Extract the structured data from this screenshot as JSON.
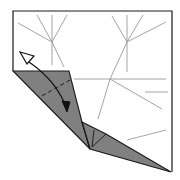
{
  "diagram": {
    "type": "origami-fold-step",
    "colors": {
      "paper_front": "#ffffff",
      "paper_back": "#808080",
      "outline": "#1a1a1a",
      "crease": "#9a9a9a",
      "arrow": "#111111"
    },
    "paper_outline": [
      [
        13,
        11
      ],
      [
        172,
        11
      ],
      [
        172,
        172
      ]
    ],
    "left_flap": [
      [
        13,
        71
      ],
      [
        69,
        71
      ],
      [
        82,
        122
      ],
      [
        90,
        149
      ]
    ],
    "lower_flap": [
      [
        82,
        122
      ],
      [
        106,
        134
      ],
      [
        171,
        172
      ],
      [
        90,
        149
      ]
    ],
    "crease_lines": [
      [
        18,
        23,
        52,
        42
      ],
      [
        37,
        15,
        52,
        42
      ],
      [
        52,
        15,
        52,
        65
      ],
      [
        67,
        15,
        52,
        42
      ],
      [
        52,
        42,
        64,
        67
      ],
      [
        112,
        16,
        127,
        42
      ],
      [
        127,
        15,
        127,
        72
      ],
      [
        143,
        15,
        127,
        42
      ],
      [
        166,
        22,
        127,
        42
      ],
      [
        127,
        42,
        110,
        79
      ],
      [
        74,
        79,
        166,
        79
      ],
      [
        110,
        79,
        162,
        109
      ],
      [
        145,
        92,
        168,
        92
      ],
      [
        110,
        79,
        98,
        119
      ],
      [
        127,
        140,
        166,
        130
      ]
    ],
    "valley_fold_line": [
      70,
      80,
      40,
      97
    ],
    "flap_inner_lines": [
      [
        82,
        122,
        90,
        149
      ],
      [
        94,
        130,
        92,
        147
      ],
      [
        106,
        134,
        92,
        147
      ]
    ],
    "arrow": {
      "kind": "fold-and-unfold",
      "from": [
        25,
        57
      ],
      "to": [
        68,
        112
      ]
    }
  }
}
